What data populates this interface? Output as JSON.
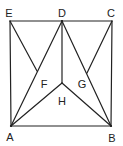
{
  "figure": {
    "type": "geometry",
    "stroke_color": "#222222",
    "background_color": "#ffffff",
    "points": {
      "A": {
        "x": 11,
        "y": 126
      },
      "B": {
        "x": 111,
        "y": 126
      },
      "C": {
        "x": 112,
        "y": 21
      },
      "D": {
        "x": 62,
        "y": 21
      },
      "E": {
        "x": 10,
        "y": 21
      },
      "F": {
        "x": 37,
        "y": 71
      },
      "G": {
        "x": 87,
        "y": 73
      },
      "H": {
        "x": 62,
        "y": 83
      }
    },
    "segments": [
      [
        "E",
        "D"
      ],
      [
        "D",
        "C"
      ],
      [
        "E",
        "A"
      ],
      [
        "C",
        "B"
      ],
      [
        "A",
        "B"
      ],
      [
        "A",
        "D"
      ],
      [
        "D",
        "B"
      ],
      [
        "E",
        "F"
      ],
      [
        "C",
        "G"
      ],
      [
        "D",
        "H"
      ],
      [
        "A",
        "H"
      ],
      [
        "B",
        "H"
      ]
    ],
    "labels": {
      "A": "A",
      "B": "B",
      "C": "C",
      "D": "D",
      "E": "E",
      "F": "F",
      "G": "G",
      "H": "H"
    },
    "label_positions": {
      "A": {
        "x": 10,
        "y": 137
      },
      "B": {
        "x": 112,
        "y": 138
      },
      "C": {
        "x": 111,
        "y": 13
      },
      "D": {
        "x": 62,
        "y": 13
      },
      "E": {
        "x": 9,
        "y": 13
      },
      "F": {
        "x": 44,
        "y": 84
      },
      "G": {
        "x": 82,
        "y": 84
      },
      "H": {
        "x": 62,
        "y": 101
      }
    }
  }
}
